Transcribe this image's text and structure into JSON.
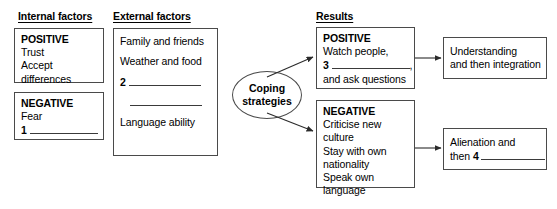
{
  "diagram": {
    "type": "flow-diagram",
    "headings": {
      "internal": "Internal factors",
      "external": "External factors",
      "results": "Results"
    },
    "internal_positive": {
      "label": "POSITIVE",
      "items": [
        "Trust",
        "Accept",
        "differences"
      ]
    },
    "internal_negative": {
      "label": "NEGATIVE",
      "items": [
        "Fear"
      ],
      "gap_number": "1",
      "gap_text": ""
    },
    "external": {
      "item1": "Family and friends",
      "item2": "Weather and food",
      "gap_number": "2",
      "gap_text": "",
      "item3": "Language ability"
    },
    "coping": {
      "line1": "Coping",
      "line2": "strategies"
    },
    "results_positive": {
      "label": "POSITIVE",
      "line1": "Watch people,",
      "gap_number": "3",
      "gap_text": "",
      "gap_suffix": ",",
      "line3": "and ask questions"
    },
    "results_negative": {
      "label": "NEGATIVE",
      "lines": [
        "Criticise new culture",
        "Stay with own",
        "nationality",
        "Speak own",
        "language"
      ]
    },
    "outcome_positive": {
      "line1": "Understanding",
      "line2": "and then integration"
    },
    "outcome_negative": {
      "line1": "Alienation and",
      "line2_prefix": "then",
      "gap_number": "4",
      "gap_text": ""
    },
    "colors": {
      "ink": "#000000",
      "border": "#4a4a4a",
      "background": "#ffffff"
    }
  }
}
